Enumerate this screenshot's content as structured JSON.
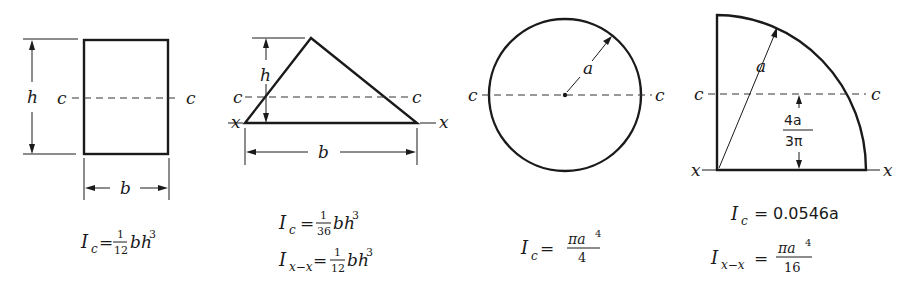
{
  "figures": [
    {
      "shape": "rectangle",
      "labels": {
        "height": "h",
        "base": "b",
        "centroid_left": "c",
        "centroid_right": "c"
      },
      "formulas": [
        {
          "lhs": "I",
          "sub": "c",
          "eq": "=",
          "num": "1",
          "den": "12",
          "tail": "bh",
          "sup": "3"
        }
      ]
    },
    {
      "shape": "triangle",
      "labels": {
        "height": "h",
        "base": "b",
        "centroid_left": "c",
        "centroid_right": "c",
        "axis_left": "x",
        "axis_right": "x"
      },
      "formulas": [
        {
          "lhs": "I",
          "sub": "c",
          "eq": "=",
          "num": "1",
          "den": "36",
          "tail": "bh",
          "sup": "3"
        },
        {
          "lhs": "I",
          "sub": "x−x",
          "eq": "=",
          "num": "1",
          "den": "12",
          "tail": "bh",
          "sup": "3"
        }
      ]
    },
    {
      "shape": "circle",
      "labels": {
        "radius": "a",
        "centroid_left": "c",
        "centroid_right": "c"
      },
      "formulas": [
        {
          "lhs": "I",
          "sub": "c",
          "eq": "=",
          "num": "πa",
          "num_sup": "4",
          "den": "4"
        }
      ]
    },
    {
      "shape": "quarter-circle",
      "labels": {
        "radius": "a",
        "centroid_left": "c",
        "centroid_right": "c",
        "axis_left": "x",
        "axis_right": "x",
        "centroid_offset_num": "4a",
        "centroid_offset_den": "3π"
      },
      "formulas": [
        {
          "lhs": "I",
          "sub": "c",
          "eq": "=",
          "value": "0.0546a"
        },
        {
          "lhs": "I",
          "sub": "x−x",
          "eq": "=",
          "num": "πa",
          "num_sup": "4",
          "den": "16"
        }
      ]
    }
  ]
}
